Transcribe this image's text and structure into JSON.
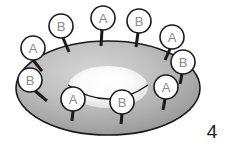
{
  "figure": {
    "number": "4",
    "shape_name": "torus",
    "colors": {
      "ring_light": "#c9c9c9",
      "ring_mid": "#a8a8a8",
      "ring_dark": "#8f8f8f",
      "hole_highlight": "#fbfbfb",
      "outline": "#1a1a1a",
      "marker_fill": "#ffffff",
      "marker_stroke": "#1a1a1a",
      "marker_label": "#8a8a8a",
      "background": "#ffffff"
    }
  },
  "markers": [
    {
      "id": "outer-1",
      "label": "A",
      "cx": 33,
      "cy": 48,
      "r": 12,
      "stem_x": 42,
      "stem_y": 71,
      "location": "outer-rim-left-upper"
    },
    {
      "id": "outer-2",
      "label": "B",
      "cx": 61,
      "cy": 26,
      "r": 12,
      "stem_x": 69,
      "stem_y": 52,
      "location": "outer-rim-top-left"
    },
    {
      "id": "outer-3",
      "label": "A",
      "cx": 103,
      "cy": 18,
      "r": 12,
      "stem_x": 101,
      "stem_y": 46,
      "location": "outer-rim-top-center"
    },
    {
      "id": "outer-4",
      "label": "B",
      "cx": 139,
      "cy": 21,
      "r": 12,
      "stem_x": 136,
      "stem_y": 47,
      "location": "outer-rim-top-right"
    },
    {
      "id": "outer-5",
      "label": "A",
      "cx": 172,
      "cy": 37,
      "r": 12,
      "stem_x": 165,
      "stem_y": 60,
      "location": "outer-rim-right-upper"
    },
    {
      "id": "outer-6",
      "label": "B",
      "cx": 183,
      "cy": 62,
      "r": 12,
      "stem_x": 180,
      "stem_y": 84,
      "location": "outer-rim-right"
    },
    {
      "id": "outer-7",
      "label": "A",
      "cx": 166,
      "cy": 87,
      "r": 12,
      "stem_x": 163,
      "stem_y": 110,
      "location": "outer-rim-right-lower"
    },
    {
      "id": "outer-8",
      "label": "B",
      "cx": 30,
      "cy": 80,
      "r": 12,
      "stem_x": 47,
      "stem_y": 101,
      "location": "outer-rim-left-lower"
    },
    {
      "id": "inner-1",
      "label": "A",
      "cx": 73,
      "cy": 99,
      "r": 12,
      "stem_x": 72,
      "stem_y": 121,
      "location": "inner-hole-left"
    },
    {
      "id": "inner-2",
      "label": "B",
      "cx": 122,
      "cy": 102,
      "r": 12,
      "stem_x": 121,
      "stem_y": 124,
      "location": "inner-hole-right"
    }
  ]
}
